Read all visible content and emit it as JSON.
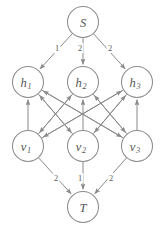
{
  "graph": {
    "title": "Layered flow network from source S to sink T",
    "colors": {
      "background": "#ffffff",
      "node_stroke": "#8c8c8c",
      "node_fill": "#ffffff",
      "edge_stroke": "#8a8a8a",
      "label_text": "#555555",
      "edge_label_text": "#5a5a5a"
    },
    "nodes": [
      {
        "id": "S",
        "base": "S",
        "sub": "",
        "cx": 83,
        "cy": 22,
        "r": 15.5,
        "role": "source"
      },
      {
        "id": "h1",
        "base": "h",
        "sub": "1",
        "cx": 28,
        "cy": 82,
        "r": 15.5,
        "role": "hidden"
      },
      {
        "id": "h2",
        "base": "h",
        "sub": "2",
        "cx": 83,
        "cy": 82,
        "r": 15.5,
        "role": "hidden"
      },
      {
        "id": "h3",
        "base": "h",
        "sub": "3",
        "cx": 137,
        "cy": 82,
        "r": 15.5,
        "role": "hidden"
      },
      {
        "id": "v1",
        "base": "v",
        "sub": "1",
        "cx": 28,
        "cy": 146,
        "r": 15.5,
        "role": "visible"
      },
      {
        "id": "v2",
        "base": "v",
        "sub": "2",
        "cx": 83,
        "cy": 146,
        "r": 15.5,
        "role": "visible"
      },
      {
        "id": "v3",
        "base": "v",
        "sub": "3",
        "cx": 137,
        "cy": 146,
        "r": 15.5,
        "role": "visible"
      },
      {
        "id": "T",
        "base": "T",
        "sub": "",
        "cx": 83,
        "cy": 207,
        "r": 15.5,
        "role": "sink"
      }
    ],
    "edges": [
      {
        "from": "S",
        "to": "h1",
        "label": "1",
        "label_x": 57,
        "label_y": 48
      },
      {
        "from": "S",
        "to": "h2",
        "label": "2",
        "label_x": 80,
        "label_y": 48
      },
      {
        "from": "S",
        "to": "h3",
        "label": "2",
        "label_x": 110,
        "label_y": 48
      },
      {
        "from": "v1",
        "to": "h1",
        "label": "",
        "label_x": 0,
        "label_y": 0
      },
      {
        "from": "v2",
        "to": "h2",
        "label": "",
        "label_x": 0,
        "label_y": 0
      },
      {
        "from": "v3",
        "to": "h3",
        "label": "",
        "label_x": 0,
        "label_y": 0
      },
      {
        "from": "v2",
        "to": "h1",
        "label": "",
        "label_x": 0,
        "label_y": 0
      },
      {
        "from": "v3",
        "to": "h1",
        "label": "",
        "label_x": 0,
        "label_y": 0
      },
      {
        "from": "v1",
        "to": "h2",
        "label": "",
        "label_x": 0,
        "label_y": 0
      },
      {
        "from": "v3",
        "to": "h2",
        "label": "",
        "label_x": 0,
        "label_y": 0
      },
      {
        "from": "v1",
        "to": "h3",
        "label": "",
        "label_x": 0,
        "label_y": 0
      },
      {
        "from": "v2",
        "to": "h3",
        "label": "",
        "label_x": 0,
        "label_y": 0
      },
      {
        "from": "h1",
        "to": "v2",
        "label": "",
        "label_x": 0,
        "label_y": 0
      },
      {
        "from": "h1",
        "to": "v3",
        "label": "",
        "label_x": 0,
        "label_y": 0
      },
      {
        "from": "h2",
        "to": "v1",
        "label": "",
        "label_x": 0,
        "label_y": 0
      },
      {
        "from": "h2",
        "to": "v3",
        "label": "",
        "label_x": 0,
        "label_y": 0
      },
      {
        "from": "h3",
        "to": "v1",
        "label": "",
        "label_x": 0,
        "label_y": 0
      },
      {
        "from": "h3",
        "to": "v2",
        "label": "",
        "label_x": 0,
        "label_y": 0
      },
      {
        "from": "v1",
        "to": "T",
        "label": "2",
        "label_x": 56,
        "label_y": 178
      },
      {
        "from": "v2",
        "to": "T",
        "label": "1",
        "label_x": 80,
        "label_y": 178
      },
      {
        "from": "v3",
        "to": "T",
        "label": "2",
        "label_x": 111,
        "label_y": 178
      }
    ]
  }
}
